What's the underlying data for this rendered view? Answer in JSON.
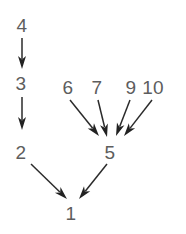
{
  "diagram": {
    "title": "",
    "background_color": "#ffffff",
    "node_color": "#5d5d5d",
    "edge_color": "#2b2b2b",
    "arrowhead_color": "#222222",
    "nodes": [
      {
        "id": "n1",
        "label": "1",
        "x": 71,
        "y": 220
      },
      {
        "id": "n2",
        "label": "2",
        "x": 21,
        "y": 159
      },
      {
        "id": "n3",
        "label": "3",
        "x": 21,
        "y": 90
      },
      {
        "id": "n4",
        "label": "4",
        "x": 22,
        "y": 32
      },
      {
        "id": "n5",
        "label": "5",
        "x": 110,
        "y": 159
      },
      {
        "id": "n6",
        "label": "6",
        "x": 68,
        "y": 94
      },
      {
        "id": "n7",
        "label": "7",
        "x": 97,
        "y": 94
      },
      {
        "id": "n9",
        "label": "9",
        "x": 131,
        "y": 94
      },
      {
        "id": "n10",
        "label": "10",
        "x": 153,
        "y": 94
      }
    ],
    "edges": [
      {
        "id": "e-4-3",
        "from": "4",
        "to": "3",
        "x1": 22,
        "y1": 38,
        "x2": 22,
        "y2": 69
      },
      {
        "id": "e-3-2",
        "from": "3",
        "to": "2",
        "x1": 22,
        "y1": 97,
        "x2": 22,
        "y2": 130
      },
      {
        "id": "e-2-1",
        "from": "2",
        "to": "1",
        "x1": 31,
        "y1": 164,
        "x2": 67,
        "y2": 199
      },
      {
        "id": "e-5-1",
        "from": "5",
        "to": "1",
        "x1": 107,
        "y1": 164,
        "x2": 79,
        "y2": 199
      },
      {
        "id": "e-6-5",
        "from": "6",
        "to": "5",
        "x1": 70,
        "y1": 100,
        "x2": 99,
        "y2": 136
      },
      {
        "id": "e-7-5",
        "from": "7",
        "to": "5",
        "x1": 98,
        "y1": 100,
        "x2": 107,
        "y2": 137
      },
      {
        "id": "e-9-5",
        "from": "9",
        "to": "5",
        "x1": 130,
        "y1": 100,
        "x2": 116,
        "y2": 136
      },
      {
        "id": "e-10-5",
        "from": "10",
        "to": "5",
        "x1": 152,
        "y1": 100,
        "x2": 124,
        "y2": 136
      }
    ]
  }
}
